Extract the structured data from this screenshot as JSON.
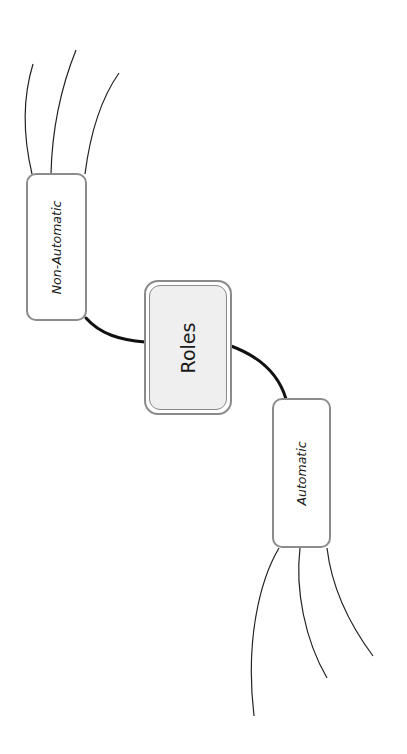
{
  "diagram": {
    "type": "mind-map",
    "central_node": {
      "label": "Roles"
    },
    "branches": [
      {
        "label": "Non-Automatic",
        "subbranch_count": 3,
        "subbranch_labels": [
          "",
          "",
          ""
        ]
      },
      {
        "label": "Automatic",
        "subbranch_count": 3,
        "subbranch_labels": [
          "",
          "",
          ""
        ]
      }
    ]
  },
  "colors": {
    "central_fill": "#efefef",
    "node_border": "#8c8c8c",
    "connector": "#111111",
    "subbranch_line": "#222222"
  }
}
